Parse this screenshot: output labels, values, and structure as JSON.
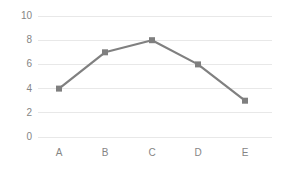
{
  "chart_data": {
    "type": "line",
    "title": "",
    "subtitle": "",
    "xlabel": "",
    "ylabel": "",
    "categories": [
      "A",
      "B",
      "C",
      "D",
      "E"
    ],
    "values": [
      4,
      7,
      8,
      6,
      3
    ],
    "series": [
      {
        "name": "Series 1",
        "values": [
          4,
          7,
          8,
          6,
          3
        ]
      }
    ],
    "ylim": [
      0,
      10
    ],
    "y_ticks": [
      0,
      2,
      4,
      6,
      8,
      10
    ],
    "y_tick_labels": [
      "0",
      "2",
      "4",
      "6",
      "8",
      "10"
    ],
    "grid": true,
    "grid_axis": "y",
    "legend": false,
    "legend_position": "none",
    "markers": "square",
    "annotations": []
  },
  "style": {
    "line_color": "#808080",
    "marker_color": "#7f7f7f",
    "grid_color": "#e8e8e8",
    "tick_label_color": "#858585",
    "background_color": "#ffffff"
  }
}
